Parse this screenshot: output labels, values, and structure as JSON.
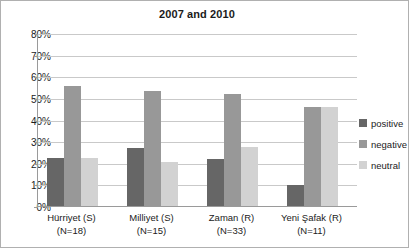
{
  "chart_data": {
    "type": "bar",
    "title": "2007 and 2010",
    "xlabel": "",
    "ylabel": "",
    "ylim": [
      0,
      80
    ],
    "ytick_labels": [
      "0%",
      "10%",
      "20%",
      "30%",
      "40%",
      "50%",
      "60%",
      "70%",
      "80%"
    ],
    "ytick_values": [
      0,
      10,
      20,
      30,
      40,
      50,
      60,
      70,
      80
    ],
    "grid": true,
    "legend_position": "right",
    "categories": [
      "Hürriyet (S)",
      "Milliyet (S)",
      "Zaman (R)",
      "Yeni Şafak (R)"
    ],
    "category_sublabels": [
      "(N=18)",
      "(N=15)",
      "(N=33)",
      "(N=11)"
    ],
    "series": [
      {
        "name": "positive",
        "color": "#666666",
        "values": [
          22.2,
          26.9,
          21.6,
          9.5
        ]
      },
      {
        "name": "negative",
        "color": "#989898",
        "values": [
          55.5,
          53.4,
          51.6,
          46.0
        ]
      },
      {
        "name": "neutral",
        "color": "#d2d2d2",
        "values": [
          22.2,
          20.5,
          27.5,
          45.6
        ]
      }
    ]
  },
  "legend": {
    "items": [
      {
        "label": "positive"
      },
      {
        "label": "negative"
      },
      {
        "label": "neutral"
      }
    ]
  }
}
